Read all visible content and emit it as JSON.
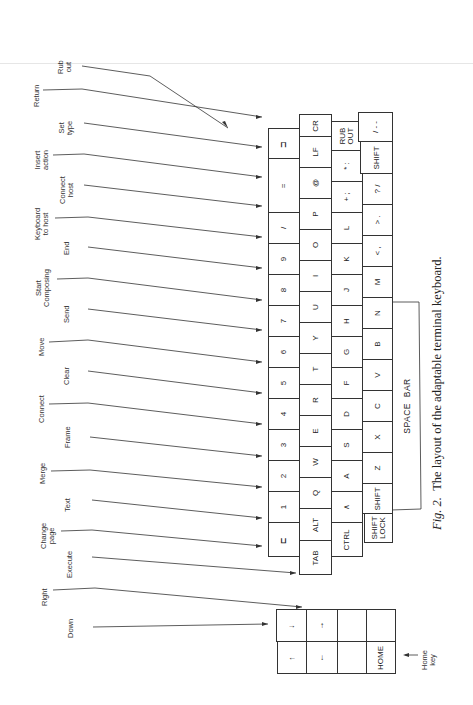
{
  "figure": {
    "caption_prefix": "Fig. 2.",
    "caption_text": "The layout of the adaptable terminal keyboard."
  },
  "keyboard": {
    "row1": [
      "⊏",
      "1",
      "2",
      "3",
      "4",
      "5",
      "6",
      "7",
      "8",
      "9",
      "/",
      "=",
      "⊐"
    ],
    "row2": [
      "TAB",
      "ALT",
      "Q",
      "W",
      "E",
      "R",
      "T",
      "Y",
      "U",
      "I",
      "O",
      "P",
      "@",
      "LF",
      "CR"
    ],
    "row3": [
      "CTRL",
      "∧",
      "A",
      "S",
      "D",
      "F",
      "G",
      "H",
      "J",
      "K",
      "L",
      "+ ;",
      "* :",
      "RUB\nOUT"
    ],
    "row4": [
      "SHIFT\nLOCK",
      "SHIFT",
      "Z",
      "X",
      "C",
      "V",
      "B",
      "N",
      "M",
      "< ,",
      "> .",
      "? /",
      "SHIFT",
      "/ - -"
    ],
    "space_bar": "SPACE  BAR"
  },
  "cursor_pad": {
    "keys": [
      "→",
      "↑",
      "",
      "",
      "←",
      "↓",
      "",
      "HOME"
    ]
  },
  "function_labels": [
    {
      "id": "rub-out",
      "text": "Rub\nout"
    },
    {
      "id": "return",
      "text": "Return"
    },
    {
      "id": "set-type",
      "text": "Set\ntype"
    },
    {
      "id": "insert-action",
      "text": "Insert\naction"
    },
    {
      "id": "connect-host",
      "text": "Connect\nhost"
    },
    {
      "id": "keyboard-to-host",
      "text": "Keyboard\nto host"
    },
    {
      "id": "end",
      "text": "End"
    },
    {
      "id": "start-composing",
      "text": "Start\nComposing"
    },
    {
      "id": "send",
      "text": "Send"
    },
    {
      "id": "move",
      "text": "Move"
    },
    {
      "id": "clear",
      "text": "Clear"
    },
    {
      "id": "connect",
      "text": "Connect"
    },
    {
      "id": "frame",
      "text": "Frame"
    },
    {
      "id": "merge",
      "text": "Merge"
    },
    {
      "id": "text",
      "text": "Text"
    },
    {
      "id": "change-page",
      "text": "Change\npage"
    },
    {
      "id": "execute",
      "text": "Execute"
    },
    {
      "id": "right",
      "text": "Right"
    },
    {
      "id": "down",
      "text": "Down"
    },
    {
      "id": "home-key",
      "text": "Home\nkey"
    }
  ]
}
